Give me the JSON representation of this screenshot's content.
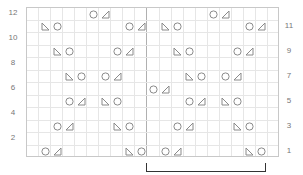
{
  "chart": {
    "columns": 21,
    "rows": 12,
    "repeat_start_col": 10,
    "repeat_end_col": 19,
    "left_labels": [
      "12",
      "10",
      "8",
      "6",
      "4",
      "2"
    ],
    "left_label_rows": [
      12,
      10,
      8,
      6,
      4,
      2
    ],
    "right_labels": [
      "11",
      "9",
      "7",
      "5",
      "3",
      "1"
    ],
    "right_label_rows": [
      11,
      9,
      7,
      5,
      3,
      1
    ],
    "symbol_legend": {
      "yo": "circle-icon (yarn over)",
      "k2tog": "right-triangle-icon (slants right)",
      "ssk": "left-triangle-icon (slants left)"
    },
    "cells": [
      {
        "row": 12,
        "col": 5,
        "sym": "yo"
      },
      {
        "row": 12,
        "col": 6,
        "sym": "k2tog"
      },
      {
        "row": 12,
        "col": 15,
        "sym": "yo"
      },
      {
        "row": 12,
        "col": 16,
        "sym": "k2tog"
      },
      {
        "row": 11,
        "col": 1,
        "sym": "ssk"
      },
      {
        "row": 11,
        "col": 2,
        "sym": "yo"
      },
      {
        "row": 11,
        "col": 8,
        "sym": "yo"
      },
      {
        "row": 11,
        "col": 9,
        "sym": "k2tog"
      },
      {
        "row": 11,
        "col": 11,
        "sym": "ssk"
      },
      {
        "row": 11,
        "col": 12,
        "sym": "yo"
      },
      {
        "row": 11,
        "col": 18,
        "sym": "yo"
      },
      {
        "row": 11,
        "col": 19,
        "sym": "k2tog"
      },
      {
        "row": 9,
        "col": 2,
        "sym": "ssk"
      },
      {
        "row": 9,
        "col": 3,
        "sym": "yo"
      },
      {
        "row": 9,
        "col": 7,
        "sym": "yo"
      },
      {
        "row": 9,
        "col": 8,
        "sym": "k2tog"
      },
      {
        "row": 9,
        "col": 12,
        "sym": "ssk"
      },
      {
        "row": 9,
        "col": 13,
        "sym": "yo"
      },
      {
        "row": 9,
        "col": 17,
        "sym": "yo"
      },
      {
        "row": 9,
        "col": 18,
        "sym": "k2tog"
      },
      {
        "row": 7,
        "col": 3,
        "sym": "ssk"
      },
      {
        "row": 7,
        "col": 4,
        "sym": "yo"
      },
      {
        "row": 7,
        "col": 6,
        "sym": "yo"
      },
      {
        "row": 7,
        "col": 7,
        "sym": "k2tog"
      },
      {
        "row": 7,
        "col": 13,
        "sym": "ssk"
      },
      {
        "row": 7,
        "col": 14,
        "sym": "yo"
      },
      {
        "row": 7,
        "col": 16,
        "sym": "yo"
      },
      {
        "row": 7,
        "col": 17,
        "sym": "k2tog"
      },
      {
        "row": 6,
        "col": 10,
        "sym": "yo"
      },
      {
        "row": 6,
        "col": 11,
        "sym": "k2tog"
      },
      {
        "row": 5,
        "col": 3,
        "sym": "yo"
      },
      {
        "row": 5,
        "col": 4,
        "sym": "k2tog"
      },
      {
        "row": 5,
        "col": 6,
        "sym": "ssk"
      },
      {
        "row": 5,
        "col": 7,
        "sym": "yo"
      },
      {
        "row": 5,
        "col": 13,
        "sym": "yo"
      },
      {
        "row": 5,
        "col": 14,
        "sym": "k2tog"
      },
      {
        "row": 5,
        "col": 16,
        "sym": "ssk"
      },
      {
        "row": 5,
        "col": 17,
        "sym": "yo"
      },
      {
        "row": 3,
        "col": 2,
        "sym": "yo"
      },
      {
        "row": 3,
        "col": 3,
        "sym": "k2tog"
      },
      {
        "row": 3,
        "col": 7,
        "sym": "ssk"
      },
      {
        "row": 3,
        "col": 8,
        "sym": "yo"
      },
      {
        "row": 3,
        "col": 12,
        "sym": "yo"
      },
      {
        "row": 3,
        "col": 13,
        "sym": "k2tog"
      },
      {
        "row": 3,
        "col": 17,
        "sym": "ssk"
      },
      {
        "row": 3,
        "col": 18,
        "sym": "yo"
      },
      {
        "row": 1,
        "col": 1,
        "sym": "yo"
      },
      {
        "row": 1,
        "col": 2,
        "sym": "k2tog"
      },
      {
        "row": 1,
        "col": 8,
        "sym": "ssk"
      },
      {
        "row": 1,
        "col": 9,
        "sym": "yo"
      },
      {
        "row": 1,
        "col": 11,
        "sym": "yo"
      },
      {
        "row": 1,
        "col": 12,
        "sym": "k2tog"
      },
      {
        "row": 1,
        "col": 18,
        "sym": "ssk"
      },
      {
        "row": 1,
        "col": 19,
        "sym": "yo"
      }
    ]
  },
  "colors": {
    "grid": "#e6e6e6",
    "border": "#c8c8c8",
    "symbol": "#8a8a8a",
    "bracket": "#333333",
    "label": "#777777"
  }
}
